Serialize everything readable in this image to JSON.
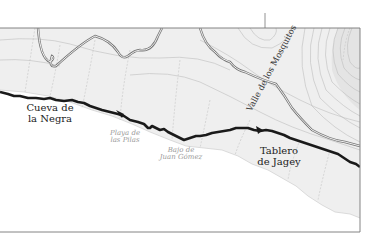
{
  "map": {
    "colors": {
      "land": "#efefef",
      "sea": "#ffffff",
      "trail": "#1a1a1a",
      "road": "#777777",
      "contour": "#b8b8b8",
      "frame": "#777777"
    },
    "labels": {
      "cueva": {
        "line1": "Cueva de",
        "line2": "la Negra"
      },
      "playa": {
        "line1": "Playa de",
        "line2": "las Pilas"
      },
      "bajo": {
        "line1": "Bajo de",
        "line2": "Juan Gómez"
      },
      "tablero": {
        "line1": "Tablero",
        "line2": "de Jagey"
      },
      "valle": "Valle de los Mosquitos"
    }
  }
}
